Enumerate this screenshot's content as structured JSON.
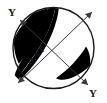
{
  "figure": {
    "type": "optical-indicatrix-circle",
    "background_color": "#ffffff",
    "outline_color": "#1a1a1a",
    "shaded_color": "#000000",
    "axis_color": "#3a3a3a",
    "circle": {
      "center_x": 53.5,
      "center_y": 48.0,
      "radius": 40.5
    },
    "labels": {
      "y_top_left": "Y",
      "y_bottom_right": "Y",
      "oap": "O.A.P"
    },
    "axes": [
      {
        "name": "y-axis",
        "label": "Y",
        "x1": 20,
        "y1": 20,
        "x2": 88,
        "y2": 85,
        "double_headed": true
      },
      {
        "name": "optic-axial-plane-trace",
        "label": "O.A.P",
        "x1": 18,
        "y1": 83,
        "x2": 92,
        "y2": 12,
        "double_headed": true
      }
    ],
    "oap_label_rotation_deg": -44
  }
}
